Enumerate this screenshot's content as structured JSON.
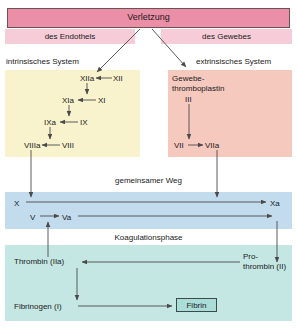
{
  "diagram": {
    "language": "de"
  },
  "colors": {
    "injury_band": "#eb8fa8",
    "injury_border": "#6b5552",
    "subband_pink": "#f7ccd9",
    "intrinsic_yellow": "#f8f3cd",
    "extrinsic_salmon": "#f6c9bf",
    "common_blue": "#c2dcee",
    "koagulation_teal": "#c4e7e4",
    "fibrin_box": "#aadcd8",
    "fibrin_border": "#3b4a4a",
    "arrow": "#4a4a4a",
    "text": "#1a1a1a"
  },
  "header": {
    "injury": "Verletzung",
    "endothel": "des Endothels",
    "gewebe": "des Gewebes"
  },
  "sections": {
    "intrinsic_label": "intrinsisches System",
    "extrinsic_label": "extrinsisches System",
    "common_path_label": "gemeinsamer Weg",
    "koagulation_label": "Koagulationsphase"
  },
  "intrinsic": {
    "factor_xii": "XII",
    "factor_xiia": "XIIa",
    "factor_xi": "XI",
    "factor_xia": "XIa",
    "factor_ix": "IX",
    "factor_ixa": "IXa",
    "factor_viii": "VIII",
    "factor_viiia": "VIIIa"
  },
  "extrinsic": {
    "tissue_factor": "Gewebe-\nthromboplastin",
    "tissue_factor_line1": "Gewebe-",
    "tissue_factor_line2": "thromboplastin",
    "factor_iii": "III",
    "factor_vii": "VII",
    "factor_viia": "VIIa"
  },
  "common_path": {
    "factor_x": "X",
    "factor_xa": "Xa",
    "factor_v": "V",
    "factor_va": "Va"
  },
  "koagulation": {
    "thrombin": "Thrombin (IIa)",
    "prothrombin_line1": "Pro-",
    "prothrombin_line2": "thrombin (II)",
    "fibrinogen": "Fibrinogen (I)",
    "fibrin": "Fibrin"
  }
}
